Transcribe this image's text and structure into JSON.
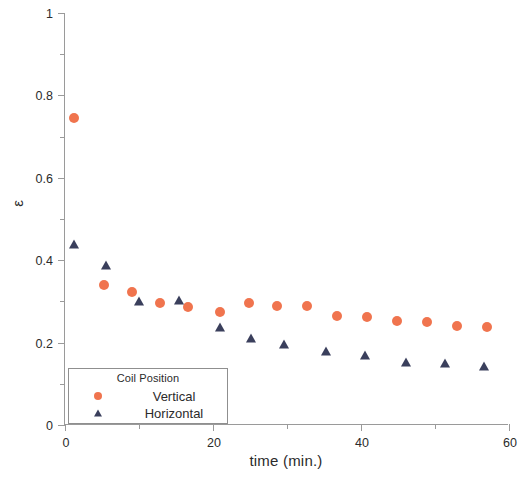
{
  "chart_data": {
    "type": "scatter",
    "title": "",
    "xlabel": "time (min.)",
    "ylabel": "ε",
    "xlim": [
      0,
      60
    ],
    "ylim": [
      0,
      1
    ],
    "grid": false,
    "x_major_ticks": [
      0,
      20,
      40,
      60
    ],
    "x_major_tick_labels": [
      "0",
      "20",
      "40",
      "60"
    ],
    "x_minor_ticks": [
      10,
      30,
      50
    ],
    "y_major_ticks": [
      0,
      0.2,
      0.4,
      0.6,
      0.8,
      1
    ],
    "y_major_tick_labels": [
      "0",
      "0.2",
      "0.4",
      "0.6",
      "0.8",
      "1"
    ],
    "y_minor_ticks": [
      0.1,
      0.3,
      0.5,
      0.7,
      0.9
    ],
    "legend": {
      "title": "Coil Position",
      "position": "lower-left-inside",
      "entries": [
        {
          "name": "Vertical",
          "marker": "circle",
          "color": "#F0744E"
        },
        {
          "name": "Horizontal",
          "marker": "triangle",
          "color": "#3A3F5C"
        }
      ]
    },
    "series": [
      {
        "name": "Vertical",
        "marker": "circle",
        "color": "#F0744E",
        "points": [
          {
            "x": 1.2,
            "y": 0.745
          },
          {
            "x": 5.3,
            "y": 0.341
          },
          {
            "x": 9.1,
            "y": 0.322
          },
          {
            "x": 12.8,
            "y": 0.296
          },
          {
            "x": 16.6,
            "y": 0.287
          },
          {
            "x": 20.9,
            "y": 0.274
          },
          {
            "x": 24.8,
            "y": 0.295
          },
          {
            "x": 28.6,
            "y": 0.289
          },
          {
            "x": 32.7,
            "y": 0.288
          },
          {
            "x": 36.8,
            "y": 0.265
          },
          {
            "x": 40.8,
            "y": 0.261
          },
          {
            "x": 44.9,
            "y": 0.253
          },
          {
            "x": 48.9,
            "y": 0.249
          },
          {
            "x": 53.0,
            "y": 0.241
          },
          {
            "x": 57.0,
            "y": 0.239
          }
        ]
      },
      {
        "name": "Horizontal",
        "marker": "triangle",
        "color": "#3A3F5C",
        "points": [
          {
            "x": 1.2,
            "y": 0.437
          },
          {
            "x": 5.6,
            "y": 0.386
          },
          {
            "x": 10.0,
            "y": 0.299
          },
          {
            "x": 15.4,
            "y": 0.302
          },
          {
            "x": 20.9,
            "y": 0.236
          },
          {
            "x": 25.2,
            "y": 0.208
          },
          {
            "x": 29.6,
            "y": 0.195
          },
          {
            "x": 35.3,
            "y": 0.176
          },
          {
            "x": 40.6,
            "y": 0.168
          },
          {
            "x": 46.1,
            "y": 0.15
          },
          {
            "x": 51.3,
            "y": 0.148
          },
          {
            "x": 56.6,
            "y": 0.141
          }
        ]
      }
    ]
  }
}
